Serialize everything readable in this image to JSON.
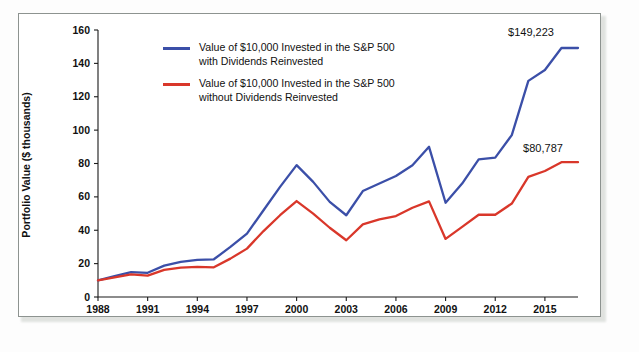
{
  "figure": {
    "name": "portfolio-value-line-chart",
    "background_color": "#ffffff",
    "frame_color": "#8d9390"
  },
  "colors": {
    "series_with_dividends": "#3b4fa8",
    "series_without_dividends": "#d9372a",
    "axis": "#111111",
    "text": "#111111"
  },
  "legend": {
    "position": "upper-left-inside",
    "entries": [
      {
        "id": "legend-with-dividends",
        "color": "#3b4fa8",
        "label": "Value of $10,000 Invested in the S&P 500\nwith Dividends Reinvested"
      },
      {
        "id": "legend-without-dividends",
        "color": "#d9372a",
        "label": "Value of $10,000 Invested in the S&P 500\nwithout Dividends Reinvested"
      }
    ]
  },
  "annotations": [
    {
      "id": "annotation-with-dividends-final",
      "text": "$149,223",
      "series": "With Dividends Reinvested"
    },
    {
      "id": "annotation-without-dividends-final",
      "text": "$80,787",
      "series": "Without Dividends Reinvested"
    }
  ],
  "axes": {
    "y": {
      "title": "Portfolio Value ($ thousands)",
      "ticks": [
        "0",
        "20",
        "40",
        "60",
        "80",
        "100",
        "120",
        "140",
        "160"
      ],
      "min": 0,
      "max": 160
    },
    "x": {
      "title": "",
      "ticks": [
        "1988",
        "1991",
        "1994",
        "1997",
        "2000",
        "2003",
        "2006",
        "2009",
        "2012",
        "2015"
      ],
      "min": 1988,
      "max": 2017
    }
  },
  "chart_data": {
    "type": "line",
    "title": "",
    "subtitle": "",
    "xlabel": "",
    "ylabel": "Portfolio Value ($ thousands)",
    "xlim": [
      1988,
      2017
    ],
    "ylim": [
      0,
      160
    ],
    "grid": false,
    "legend_position": "upper left",
    "x": [
      1988,
      1989,
      1990,
      1991,
      1992,
      1993,
      1994,
      1995,
      1996,
      1997,
      1998,
      1999,
      2000,
      2001,
      2002,
      2003,
      2004,
      2005,
      2006,
      2007,
      2008,
      2009,
      2010,
      2011,
      2012,
      2013,
      2014,
      2015,
      2016,
      2017
    ],
    "xtick_labels": [
      "1988",
      "1991",
      "1994",
      "1997",
      "2000",
      "2003",
      "2006",
      "2009",
      "2012",
      "2015"
    ],
    "ytick_labels": [
      "0",
      "20",
      "40",
      "60",
      "80",
      "100",
      "120",
      "140",
      "160"
    ],
    "series": [
      {
        "name": "Value of $10,000 Invested in the S&P 500 with Dividends Reinvested",
        "short_name": "With Dividends Reinvested",
        "color": "#3b4fa8",
        "end_label": "$149,223",
        "values": [
          10.0,
          12.5,
          14.9,
          14.5,
          18.8,
          21.0,
          22.3,
          22.6,
          30.0,
          38.0,
          52.0,
          66.0,
          79.0,
          69.0,
          57.0,
          49.0,
          63.5,
          68.0,
          72.5,
          79.0,
          90.0,
          56.5,
          68.0,
          82.5,
          83.5,
          97.0,
          129.5,
          136.0,
          149.2,
          149.2
        ]
      },
      {
        "name": "Value of $10,000 Invested in the S&P 500 without Dividends Reinvested",
        "short_name": "Without Dividends Reinvested",
        "color": "#d9372a",
        "end_label": "$80,787",
        "values": [
          10.0,
          11.8,
          13.6,
          12.8,
          16.3,
          17.6,
          18.0,
          17.8,
          23.0,
          29.0,
          39.5,
          49.0,
          57.5,
          50.0,
          41.5,
          34.0,
          43.5,
          46.5,
          48.5,
          53.5,
          57.3,
          34.8,
          42.0,
          49.3,
          49.3,
          56.0,
          72.0,
          75.5,
          80.8,
          80.8
        ]
      }
    ],
    "annotations": [
      {
        "text": "$149,223",
        "series": "With Dividends Reinvested",
        "x": 2016,
        "y": 149.2
      },
      {
        "text": "$80,787",
        "series": "Without Dividends Reinvested",
        "x": 2016,
        "y": 80.8
      }
    ]
  }
}
